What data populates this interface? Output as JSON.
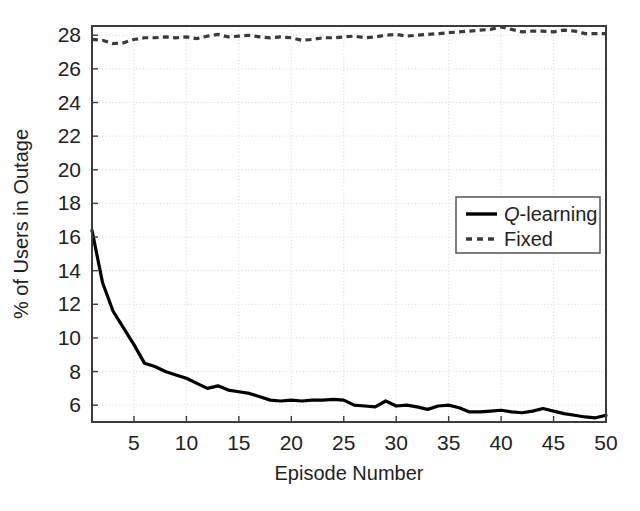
{
  "chart_data": {
    "type": "line",
    "title": "",
    "xlabel": "Episode Number",
    "ylabel": "% of Users in Outage",
    "xlim": [
      1,
      50
    ],
    "ylim": [
      5.0,
      28.55
    ],
    "xticks": [
      5,
      10,
      15,
      20,
      25,
      30,
      35,
      40,
      45,
      50
    ],
    "yticks": [
      6,
      8,
      10,
      12,
      14,
      16,
      18,
      20,
      22,
      24,
      26,
      28
    ],
    "grid": true,
    "grid_style": "dotted",
    "legend_position": "center-right",
    "x": [
      1,
      2,
      3,
      4,
      5,
      6,
      7,
      8,
      9,
      10,
      11,
      12,
      13,
      14,
      15,
      16,
      17,
      18,
      19,
      20,
      21,
      22,
      23,
      24,
      25,
      26,
      27,
      28,
      29,
      30,
      31,
      32,
      33,
      34,
      35,
      36,
      37,
      38,
      39,
      40,
      41,
      42,
      43,
      44,
      45,
      46,
      47,
      48,
      49,
      50
    ],
    "series": [
      {
        "name": "Q-learning",
        "style": "solid",
        "color": "#000000",
        "values": [
          16.4,
          13.3,
          11.6,
          10.6,
          9.6,
          8.5,
          8.3,
          8.0,
          7.8,
          7.6,
          7.3,
          7.0,
          7.15,
          6.9,
          6.8,
          6.7,
          6.5,
          6.3,
          6.25,
          6.3,
          6.25,
          6.3,
          6.3,
          6.35,
          6.3,
          6.0,
          5.95,
          5.9,
          6.25,
          5.95,
          6.0,
          5.9,
          5.75,
          5.95,
          6.0,
          5.85,
          5.6,
          5.6,
          5.65,
          5.7,
          5.6,
          5.55,
          5.65,
          5.8,
          5.65,
          5.5,
          5.4,
          5.3,
          5.25,
          5.4
        ]
      },
      {
        "name": "Fixed",
        "style": "dashed",
        "color": "#3a3a3a",
        "values": [
          27.75,
          27.7,
          27.5,
          27.55,
          27.75,
          27.85,
          27.85,
          27.9,
          27.85,
          27.9,
          27.8,
          27.95,
          28.05,
          27.9,
          27.95,
          28.0,
          27.9,
          27.85,
          27.9,
          27.85,
          27.7,
          27.75,
          27.85,
          27.85,
          27.9,
          27.95,
          27.85,
          27.9,
          28.0,
          28.05,
          27.95,
          28.0,
          28.05,
          28.1,
          28.15,
          28.2,
          28.25,
          28.3,
          28.35,
          28.5,
          28.35,
          28.2,
          28.25,
          28.25,
          28.2,
          28.3,
          28.25,
          28.1,
          28.1,
          28.1
        ]
      }
    ],
    "legend": [
      {
        "label": "Q-learning",
        "emphasis_prefix": "Q",
        "rest": "-learning",
        "style": "solid"
      },
      {
        "label": "Fixed",
        "emphasis_prefix": "",
        "rest": "Fixed",
        "style": "dashed"
      }
    ]
  },
  "axes": {
    "x_tick_labels": [
      "5",
      "10",
      "15",
      "20",
      "25",
      "30",
      "35",
      "40",
      "45",
      "50"
    ],
    "y_tick_labels": [
      "6",
      "8",
      "10",
      "12",
      "14",
      "16",
      "18",
      "20",
      "22",
      "24",
      "26",
      "28"
    ],
    "x_axis_title": "Episode Number",
    "y_axis_title": "% of Users in Outage"
  },
  "colors": {
    "background": "#ffffff",
    "axis": "#3c3c3c",
    "grid": "#d8d8d8",
    "qlearning": "#000000",
    "fixed": "#3a3a3a",
    "text": "#222222"
  }
}
